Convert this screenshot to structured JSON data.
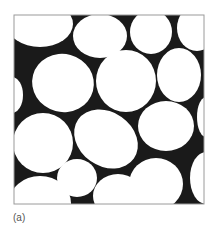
{
  "figure": {
    "label": "(a)",
    "frame": {
      "x": 14,
      "y": 15,
      "width": 190,
      "height": 189,
      "stroke": "#9a9a9a"
    },
    "colors": {
      "matrix": "#1a1a1a",
      "grain": "#ffffff",
      "background": "#ffffff",
      "label": "#555555"
    },
    "grains": [
      {
        "cx": 40,
        "cy": 24,
        "rx": 33,
        "ry": 23,
        "rot": 0
      },
      {
        "cx": 100,
        "cy": 36,
        "rx": 27,
        "ry": 22,
        "rot": 0
      },
      {
        "cx": 151,
        "cy": 32,
        "rx": 21,
        "ry": 22,
        "rot": 0
      },
      {
        "cx": 197,
        "cy": 28,
        "rx": 20,
        "ry": 23,
        "rot": 0
      },
      {
        "cx": 63,
        "cy": 83,
        "rx": 31,
        "ry": 29,
        "rot": 15
      },
      {
        "cx": 126,
        "cy": 81,
        "rx": 30,
        "ry": 31,
        "rot": 0
      },
      {
        "cx": 179,
        "cy": 75,
        "rx": 22,
        "ry": 27,
        "rot": 0
      },
      {
        "cx": 12,
        "cy": 95,
        "rx": 11,
        "ry": 18,
        "rot": 0
      },
      {
        "cx": 43,
        "cy": 143,
        "rx": 30,
        "ry": 30,
        "rot": 0
      },
      {
        "cx": 106,
        "cy": 139,
        "rx": 34,
        "ry": 27,
        "rot": 35
      },
      {
        "cx": 166,
        "cy": 126,
        "rx": 28,
        "ry": 25,
        "rot": 0
      },
      {
        "cx": 206,
        "cy": 117,
        "rx": 9,
        "ry": 20,
        "rot": 0
      },
      {
        "cx": 77,
        "cy": 178,
        "rx": 20,
        "ry": 19,
        "rot": 0
      },
      {
        "cx": 40,
        "cy": 203,
        "rx": 31,
        "ry": 27,
        "rot": 0
      },
      {
        "cx": 118,
        "cy": 196,
        "rx": 25,
        "ry": 22,
        "rot": 0
      },
      {
        "cx": 156,
        "cy": 184,
        "rx": 27,
        "ry": 26,
        "rot": 0
      },
      {
        "cx": 206,
        "cy": 178,
        "rx": 16,
        "ry": 26,
        "rot": 0
      }
    ]
  }
}
